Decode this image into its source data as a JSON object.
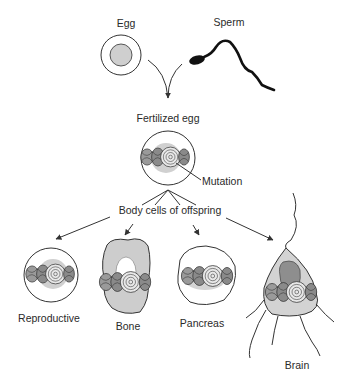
{
  "diagram": {
    "labels": {
      "egg": "Egg",
      "sperm": "Sperm",
      "fertilized_egg": "Fertilized egg",
      "mutation": "Mutation",
      "body_cells": "Body cells of offspring",
      "reproductive": "Reproductive",
      "bone": "Bone",
      "pancreas": "Pancreas",
      "brain": "Brain"
    },
    "nodes": [
      {
        "id": "egg",
        "label": "Egg",
        "shape": "circle-cell"
      },
      {
        "id": "sperm",
        "label": "Sperm",
        "shape": "sperm"
      },
      {
        "id": "fertilized_egg",
        "label": "Fertilized egg",
        "shape": "circle-cell-with-dna"
      },
      {
        "id": "reproductive",
        "label": "Reproductive",
        "shape": "circle-cell-with-dna"
      },
      {
        "id": "bone",
        "label": "Bone",
        "shape": "irregular-cell-with-dna"
      },
      {
        "id": "pancreas",
        "label": "Pancreas",
        "shape": "oval-cell-with-dna"
      },
      {
        "id": "brain",
        "label": "Brain",
        "shape": "neuron-with-dna"
      }
    ],
    "edges": [
      {
        "from": "egg",
        "to": "fertilized_egg"
      },
      {
        "from": "sperm",
        "to": "fertilized_egg"
      },
      {
        "from": "fertilized_egg",
        "to": "reproductive"
      },
      {
        "from": "fertilized_egg",
        "to": "bone"
      },
      {
        "from": "fertilized_egg",
        "to": "pancreas"
      },
      {
        "from": "fertilized_egg",
        "to": "brain"
      }
    ],
    "colors": {
      "line": "#333333",
      "cell_fill": "#d0d0d0",
      "nucleus_fill": "#c4c4c4",
      "dark_fill": "#8a8a8a",
      "background": "#ffffff"
    }
  }
}
